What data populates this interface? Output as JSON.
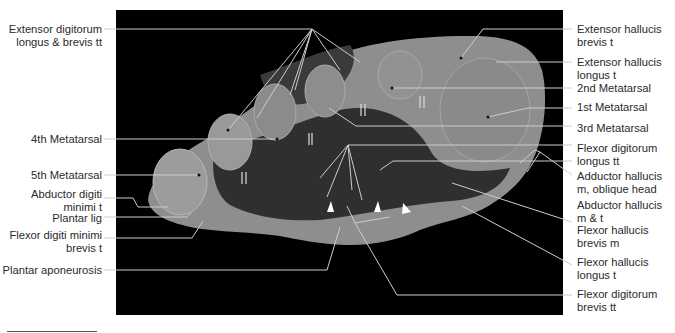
{
  "figure": {
    "background": "#000000",
    "tissue_colors": {
      "bone": "#8a8a8a",
      "soft_tissue": "#9a9a9a",
      "dark_tissue": "#2e2e2e"
    }
  },
  "labels_left": [
    {
      "id": "ext-dig",
      "lines": [
        "Extensor digitorum",
        "longus & brevis tt"
      ]
    },
    {
      "id": "mt4",
      "lines": [
        "4th Metatarsal"
      ]
    },
    {
      "id": "mt5",
      "lines": [
        "5th Metatarsal"
      ]
    },
    {
      "id": "abd-dm",
      "lines": [
        "Abductor digiti",
        "minimi t"
      ]
    },
    {
      "id": "plantar-lig",
      "lines": [
        "Plantar lig"
      ]
    },
    {
      "id": "fdmb",
      "lines": [
        "Flexor digiti minimi",
        "brevis t"
      ]
    },
    {
      "id": "plantar-apo",
      "lines": [
        "Plantar aponeurosis"
      ]
    }
  ],
  "labels_right": [
    {
      "id": "ehb",
      "lines": [
        "Extensor hallucis",
        "brevis t"
      ]
    },
    {
      "id": "ehl",
      "lines": [
        "Extensor hallucis",
        "longus t"
      ]
    },
    {
      "id": "mt2",
      "lines": [
        "2nd Metatarsal"
      ]
    },
    {
      "id": "mt1",
      "lines": [
        "1st Metatarsal"
      ]
    },
    {
      "id": "mt3",
      "lines": [
        "3rd Metatarsal"
      ]
    },
    {
      "id": "fdl",
      "lines": [
        "Flexor digitorum",
        "longus tt"
      ]
    },
    {
      "id": "add-h",
      "lines": [
        "Adductor hallucis",
        "m, oblique head"
      ]
    },
    {
      "id": "abd-h",
      "lines": [
        "Abductor hallucis",
        "m & t"
      ]
    },
    {
      "id": "fhb",
      "lines": [
        "Flexor hallucis",
        "brevis m"
      ]
    },
    {
      "id": "fhl",
      "lines": [
        "Flexor hallucis",
        "longus t"
      ]
    },
    {
      "id": "fdb",
      "lines": [
        "Flexor digitorum",
        "brevis tt"
      ]
    }
  ]
}
